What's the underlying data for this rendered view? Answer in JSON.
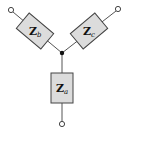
{
  "diagram": {
    "type": "wye-connected impedances",
    "center_node": {
      "x": 62,
      "y": 53
    },
    "branches": [
      {
        "id": "b",
        "label": "Z",
        "subscript": "b",
        "position": "upper-left",
        "terminal": {
          "x": 11,
          "y": 10
        }
      },
      {
        "id": "c",
        "label": "Z",
        "subscript": "c",
        "position": "upper-right",
        "terminal": {
          "x": 118,
          "y": 9
        }
      },
      {
        "id": "a",
        "label": "Z",
        "subscript": "a",
        "position": "bottom",
        "terminal": {
          "x": 62,
          "y": 124
        }
      }
    ],
    "colors": {
      "box_fill": "#dcdcdc",
      "outline": "#444444",
      "wire": "#555555",
      "node": "#111111"
    }
  }
}
